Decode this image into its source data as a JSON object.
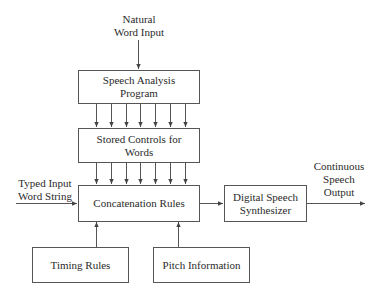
{
  "diagram": {
    "type": "block-diagram",
    "line_color": "#555555",
    "text_color": "#2a2a2a",
    "inputs": {
      "natural": {
        "line1": "Natural",
        "line2": "Word Input"
      },
      "typed": {
        "line1": "Typed Input",
        "line2": "Word String"
      }
    },
    "output": {
      "line1": "Continuous",
      "line2": "Speech",
      "line3": "Output"
    },
    "boxes": {
      "speech_analysis": {
        "line1": "Speech Analysis",
        "line2": "Program"
      },
      "stored_controls": {
        "line1": "Stored Controls for",
        "line2": "Words"
      },
      "concatenation": {
        "line1": "Concatenation Rules"
      },
      "synthesizer": {
        "line1": "Digital Speech",
        "line2": "Synthesizer"
      },
      "timing": {
        "line1": "Timing Rules"
      },
      "pitch": {
        "line1": "Pitch Information"
      }
    },
    "connections": [
      {
        "from": "Natural Word Input",
        "to": "Speech Analysis Program",
        "count": 1
      },
      {
        "from": "Speech Analysis Program",
        "to": "Stored Controls for Words",
        "count": 7
      },
      {
        "from": "Stored Controls for Words",
        "to": "Concatenation Rules",
        "count": 7
      },
      {
        "from": "Typed Input Word String",
        "to": "Concatenation Rules",
        "count": 1
      },
      {
        "from": "Timing Rules",
        "to": "Concatenation Rules",
        "count": 1
      },
      {
        "from": "Pitch Information",
        "to": "Concatenation Rules",
        "count": 1
      },
      {
        "from": "Concatenation Rules",
        "to": "Digital Speech Synthesizer",
        "count": 1
      },
      {
        "from": "Digital Speech Synthesizer",
        "to": "Continuous Speech Output",
        "count": 1
      }
    ]
  }
}
